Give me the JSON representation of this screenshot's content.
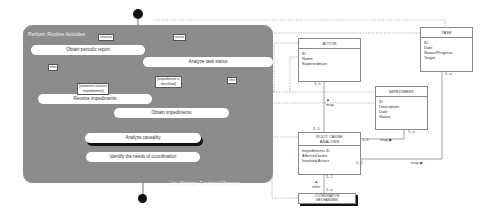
{
  "swimlane": {
    "title": "Perform Routine Activities",
    "footer": "Line Manager, Functional Manager"
  },
  "activities": {
    "obtain_periodic_report": "Obtain periodic report",
    "analyze_task_status": "Analyze task status",
    "receive_impediments": "Receive impediments",
    "obtain_impediments": "Obtain impediments",
    "analyze_causality": "Analyze causality",
    "identify_coordination": "Identify the needs of coordination"
  },
  "guards": {
    "reactive": "reactive",
    "active": "active",
    "else_left": "else",
    "someone_initiates_line1": "[someone initiates",
    "someone_initiates_line2": "impediments]",
    "impediment_identified_line1": "[impediment is",
    "impediment_identified_line2": "identified]",
    "else_right": "else"
  },
  "entities": {
    "actor": {
      "name": "ACTOR",
      "attributes": [
        "ID",
        "Name",
        "Superordinate"
      ]
    },
    "task": {
      "name": "TASK",
      "attributes": [
        "ID",
        "Date",
        "Status/Progress",
        "Target"
      ]
    },
    "impediment": {
      "name": "IMPEDIMENT",
      "attributes": [
        "ID",
        "Description",
        "Date",
        "Status"
      ]
    },
    "root_cause": {
      "name_line1": "ROOT CAUSE",
      "name_line2": "ANALYSIS",
      "attributes": [
        "Impediments ID",
        "Affected tasks",
        "Involved Actors"
      ]
    },
    "coordination": {
      "name_line1": "COORDINATION",
      "name_line2": "MECHANISMS"
    }
  },
  "relations": {
    "actor_rca": {
      "label": "map",
      "mult_top": "1..n",
      "mult_bottom": "1..1"
    },
    "impediment_rca": {
      "label": "map",
      "mult_left": "1..1",
      "mult_right": "1..n"
    },
    "task_rca": {
      "label": "map",
      "mult_left": "1..1",
      "mult_top": "1..n"
    },
    "rca_coord": {
      "label": "refer",
      "mult_top": "1..1",
      "mult_bottom": "1..n"
    }
  },
  "colors": {
    "swimlane": "#8c8c8c",
    "activity": "#ffffff",
    "node": "#111111",
    "line": "#555555"
  }
}
